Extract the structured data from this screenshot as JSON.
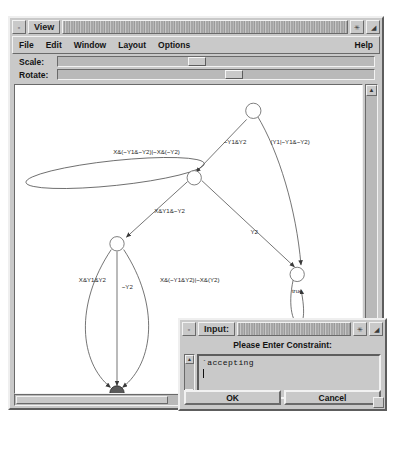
{
  "view_window": {
    "title": "View",
    "titlebar_buttons": {
      "menu_label": "▫",
      "maximize_label": "✳",
      "restore_label": "◢"
    },
    "menus": [
      "File",
      "Edit",
      "Window",
      "Layout",
      "Options"
    ],
    "help_menu": "Help",
    "controls": [
      {
        "label": "Scale:",
        "value_pct": 41
      },
      {
        "label": "Rotate:",
        "value_pct": 53
      }
    ],
    "scroll": {
      "up_arrow": "▲",
      "down_arrow": "▼",
      "left_arrow": "◀",
      "right_arrow": "▶"
    }
  },
  "graph": {
    "nodes": [
      {
        "id": "n_top",
        "label": "",
        "cx": 268,
        "cy": 95,
        "r": 8,
        "filled": false
      },
      {
        "id": "n_center",
        "label": "",
        "cx": 190,
        "cy": 160,
        "r": 7.5,
        "filled": false
      },
      {
        "id": "n_left",
        "label": "",
        "cx": 120,
        "cy": 234,
        "r": 7.5,
        "filled": false
      },
      {
        "id": "n_true",
        "label": "true",
        "cx": 311,
        "cy": 268,
        "r": 7.5,
        "filled": false
      },
      {
        "id": "n_accept",
        "label": "",
        "cx": 120,
        "cy": 395,
        "r": 7.5,
        "filled": true
      }
    ],
    "edges": [
      {
        "from": "n_center",
        "to": "n_center",
        "label": "X&(~Y1&~Y2)|~X&(~Y2)"
      },
      {
        "from": "n_top",
        "to": "n_center",
        "label": "~Y1&Y2"
      },
      {
        "from": "n_top",
        "to": "n_true",
        "label": "(Y1|~Y1&~Y2)"
      },
      {
        "from": "n_center",
        "to": "n_left",
        "label": "X&Y1&~Y2"
      },
      {
        "from": "n_center",
        "to": "n_true",
        "label": "Y2"
      },
      {
        "from": "n_left",
        "to": "n_accept",
        "label": "X&Y1&Y2"
      },
      {
        "from": "n_left",
        "to": "n_accept",
        "label": "~Y2"
      },
      {
        "from": "n_left",
        "to": "n_accept",
        "label": "X&(~Y1&Y2)|~X&(Y2)"
      },
      {
        "from": "n_true",
        "to": "n_true",
        "label": ""
      }
    ]
  },
  "dialog": {
    "title": "Input:",
    "titlebar_buttons": {
      "menu_label": "▫",
      "maximize_label": "✳",
      "restore_label": "◢"
    },
    "prompt": "Please Enter Constraint:",
    "text_value": "`accepting",
    "ok_label": "OK",
    "cancel_label": "Cancel",
    "scroll": {
      "up_arrow": "▲",
      "down_arrow": "▼"
    }
  }
}
